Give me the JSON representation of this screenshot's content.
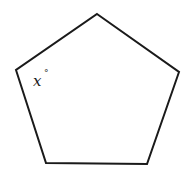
{
  "diagram": {
    "shape": "regular pentagon",
    "stroke_color": "#1a1a1a",
    "background": "#ffffff",
    "vertices": [
      [
        97,
        14
      ],
      [
        179,
        72
      ],
      [
        147,
        164
      ],
      [
        46,
        163
      ],
      [
        16,
        70
      ]
    ],
    "angle_label": {
      "variable": "x",
      "unit": "°",
      "vertex_index": 4
    }
  }
}
